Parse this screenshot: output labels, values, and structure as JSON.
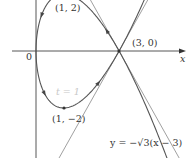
{
  "figure": {
    "type": "parametric-curve-diagram",
    "curve": {
      "x_of_t": "t^2",
      "y_of_t": "t^3 - 3t"
    },
    "axes": {
      "x_label": "x",
      "origin_label": "0"
    },
    "points": [
      {
        "label": "(1, 2)",
        "x": 1,
        "y": 2
      },
      {
        "label": "(3, 0)",
        "x": 3,
        "y": 0
      },
      {
        "label": "(1, −2)",
        "x": 1,
        "y": -2
      }
    ],
    "parameter_label": "t = 1",
    "tangent_lines": [
      {
        "equation": "y = √3(x − 3)",
        "slope": 1.732,
        "shown_label": false
      },
      {
        "equation_label": "y = −√3(x − 3)",
        "slope": -1.732,
        "shown_label": true
      }
    ],
    "colors": {
      "curve": "#555555",
      "axes": "#444444",
      "text": "#333333",
      "faint_text": "#c8c8c8"
    }
  }
}
